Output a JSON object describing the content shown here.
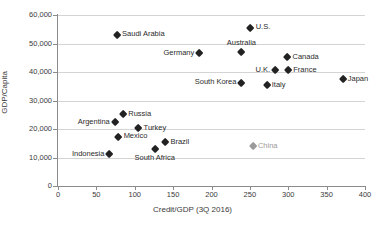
{
  "chart_data": {
    "type": "scatter",
    "title": "",
    "xlabel": "Credit/GDP (3Q 2016)",
    "ylabel": "GDP/Capita",
    "xlim": [
      0,
      400
    ],
    "ylim": [
      0,
      60000
    ],
    "xticks": [
      "0",
      "50",
      "100",
      "150",
      "200",
      "250",
      "300",
      "350",
      "400"
    ],
    "yticks": [
      "0",
      "10,000",
      "20,000",
      "30,000",
      "40,000",
      "50,000",
      "60,000"
    ],
    "xtick_values": [
      0,
      50,
      100,
      150,
      200,
      250,
      300,
      350,
      400
    ],
    "ytick_values": [
      0,
      10000,
      20000,
      30000,
      40000,
      50000,
      60000
    ],
    "grid": "horizontal",
    "legend": "none",
    "marker_shape": "diamond",
    "colors": {
      "marker": "#222222",
      "highlight": "#9b9b9b",
      "gridline": "#d4d4d4",
      "axis": "#8b8b8b",
      "text": "#3a3a3a"
    },
    "points": [
      {
        "name": "Saudi Arabia",
        "x": 77,
        "y": 53000,
        "label_pos": "right",
        "color": "dark"
      },
      {
        "name": "U.S.",
        "x": 251,
        "y": 55500,
        "label_pos": "right",
        "color": "dark"
      },
      {
        "name": "Australia",
        "x": 239,
        "y": 47000,
        "label_pos": "above",
        "color": "dark"
      },
      {
        "name": "Germany",
        "x": 184,
        "y": 46500,
        "label_pos": "left",
        "color": "dark"
      },
      {
        "name": "Canada",
        "x": 299,
        "y": 45200,
        "label_pos": "right",
        "color": "dark"
      },
      {
        "name": "U.K.",
        "x": 283,
        "y": 40700,
        "label_pos": "left",
        "color": "dark"
      },
      {
        "name": "France",
        "x": 300,
        "y": 40700,
        "label_pos": "right",
        "color": "dark"
      },
      {
        "name": "Japan",
        "x": 371,
        "y": 37500,
        "label_pos": "right",
        "color": "dark"
      },
      {
        "name": "South Korea",
        "x": 239,
        "y": 36200,
        "label_pos": "left",
        "color": "dark"
      },
      {
        "name": "Italy",
        "x": 272,
        "y": 35200,
        "label_pos": "right",
        "color": "dark"
      },
      {
        "name": "Russia",
        "x": 85,
        "y": 25200,
        "label_pos": "right",
        "color": "dark"
      },
      {
        "name": "Argentina",
        "x": 74,
        "y": 22300,
        "label_pos": "left",
        "color": "dark"
      },
      {
        "name": "Turkey",
        "x": 105,
        "y": 20300,
        "label_pos": "right",
        "color": "dark"
      },
      {
        "name": "Mexico",
        "x": 79,
        "y": 17300,
        "label_pos": "right",
        "color": "dark"
      },
      {
        "name": "Brazil",
        "x": 140,
        "y": 15300,
        "label_pos": "right",
        "color": "dark"
      },
      {
        "name": "China",
        "x": 254,
        "y": 13800,
        "label_pos": "right",
        "color": "gray"
      },
      {
        "name": "South Africa",
        "x": 126,
        "y": 13000,
        "label_pos": "below",
        "color": "dark"
      },
      {
        "name": "Indonesia",
        "x": 67,
        "y": 11000,
        "label_pos": "left",
        "color": "dark"
      }
    ]
  }
}
